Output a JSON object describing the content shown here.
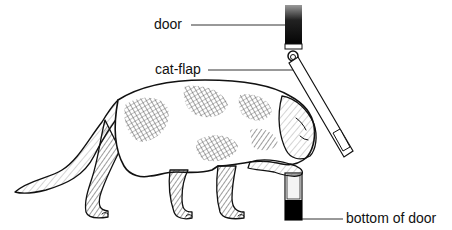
{
  "diagram": {
    "labels": {
      "door": "door",
      "cat_flap": "cat-flap",
      "bottom_of_door": "bottom of door"
    },
    "components": [
      {
        "id": "door-upper",
        "description": "upper section of door (dark gradient)"
      },
      {
        "id": "hinge",
        "description": "cat-flap hinge"
      },
      {
        "id": "cat-flap",
        "description": "flap pushed open at an angle by cat's head"
      },
      {
        "id": "door-lower",
        "description": "bottom section of door (white over black)"
      },
      {
        "id": "cat",
        "description": "hatched line drawing of cat pushing through cat-flap"
      }
    ],
    "colors": {
      "ink": "#111111",
      "background": "#ffffff"
    }
  }
}
